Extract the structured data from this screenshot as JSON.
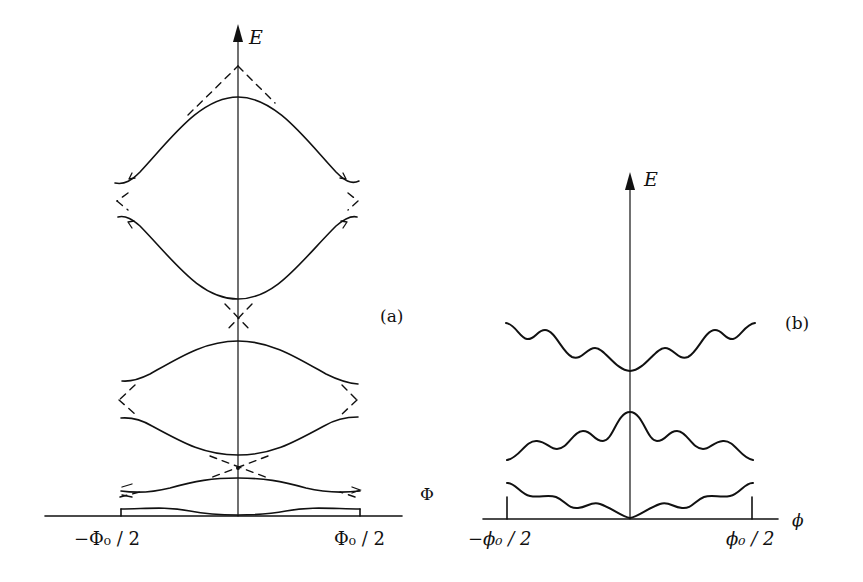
{
  "figure": {
    "panel_a": {
      "label": "(a)",
      "y_axis_label": "E",
      "x_axis_label": "Φ",
      "tick_left": "−Φ₀ / 2",
      "tick_right": "Φ₀ / 2",
      "description": "Energy bands vs flux with avoided crossings (solid) and unperturbed crossing parabolas (dashed)"
    },
    "panel_b": {
      "label": "(b)",
      "y_axis_label": "E",
      "x_axis_label": "ϕ",
      "tick_left": "−ϕ₀ / 2",
      "tick_right": "ϕ₀ / 2",
      "description": "Three oscillating energy bands vs flux"
    }
  },
  "colors": {
    "ink": "#111111",
    "background": "#ffffff"
  }
}
